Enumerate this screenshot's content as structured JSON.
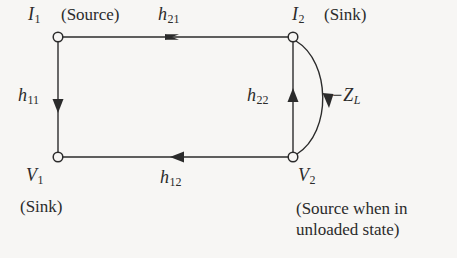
{
  "figure": {
    "type": "signal-flow-graph",
    "background_color": "#f7f6f4",
    "line_color": "#2b2b2b"
  },
  "nodes": [
    {
      "id": "I1",
      "symbol": "I",
      "subscript": "1",
      "x": 58,
      "y": 37,
      "role": "(Source)"
    },
    {
      "id": "I2",
      "symbol": "I",
      "subscript": "2",
      "x": 293,
      "y": 37,
      "role": "(Sink)"
    },
    {
      "id": "V1",
      "symbol": "V",
      "subscript": "1",
      "x": 58,
      "y": 157,
      "role": "(Sink)"
    },
    {
      "id": "V2",
      "symbol": "V",
      "subscript": "2",
      "x": 293,
      "y": 157,
      "role": "(Source when in unloaded state)"
    }
  ],
  "labels": {
    "i1": {
      "symbol": "I",
      "subscript": "1"
    },
    "i2": {
      "symbol": "I",
      "subscript": "2"
    },
    "v1": {
      "symbol": "V",
      "subscript": "1"
    },
    "v2": {
      "symbol": "V",
      "subscript": "2"
    },
    "h11": {
      "symbol": "h",
      "subscript": "11"
    },
    "h12": {
      "symbol": "h",
      "subscript": "12"
    },
    "h21": {
      "symbol": "h",
      "subscript": "21"
    },
    "h22": {
      "symbol": "h",
      "subscript": "22"
    },
    "zl": {
      "symbol": "−Z",
      "subscript": "L"
    },
    "source_top_left": "(Source)",
    "sink_top_right": "(Sink)",
    "sink_bottom_left": "(Sink)",
    "source_bottom_right": "(Source when in unloaded state)"
  },
  "edges": [
    {
      "name": "h21",
      "from": "I1",
      "to": "I2",
      "direction": "right",
      "path": "top"
    },
    {
      "name": "h11",
      "from": "I1",
      "to": "V1",
      "direction": "down",
      "path": "left"
    },
    {
      "name": "h12",
      "from": "V2",
      "to": "V1",
      "direction": "left",
      "path": "bottom"
    },
    {
      "name": "h22",
      "from": "V2",
      "to": "I2",
      "direction": "up",
      "path": "right-straight"
    },
    {
      "name": "-ZL",
      "from": "I2",
      "to": "V2",
      "direction": "down",
      "path": "right-arc"
    }
  ]
}
